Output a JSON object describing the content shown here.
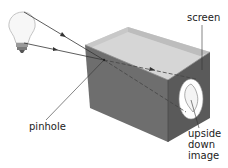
{
  "diagram": {
    "labels": {
      "screen": "screen",
      "pinhole": "pinhole",
      "image_line1": "upside",
      "image_line2": "down",
      "image_line3": "image"
    },
    "elements": [
      "light bulb",
      "light rays with arrows",
      "box",
      "pinhole",
      "screen",
      "inverted image of bulb"
    ],
    "colors": {
      "box_front": "#6e6e6e",
      "box_side": "#5a5a5a",
      "box_inner_back": "#d6d6d6",
      "box_inner_side": "#bdbdbd",
      "ray": "#333333",
      "screen_image": "#ffffff"
    }
  }
}
